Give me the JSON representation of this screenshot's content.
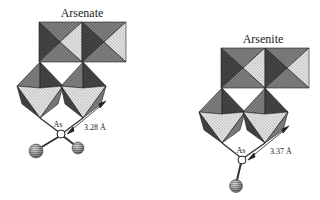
{
  "figure": {
    "panels": [
      {
        "title": "Arsenate",
        "atom_label": "As",
        "distance_label": "3.28 Å",
        "ligand_count": 2
      },
      {
        "title": "Arsenite",
        "atom_label": "As",
        "distance_label": "3.37 Å",
        "ligand_count": 1
      }
    ],
    "colors": {
      "dark_face": "#3a3a3a",
      "mid_face": "#6e6e6e",
      "light_face": "#d8d8d8",
      "edge": "#1e1e1e",
      "bond": "#333333",
      "ball": "#9a9a9a"
    }
  }
}
